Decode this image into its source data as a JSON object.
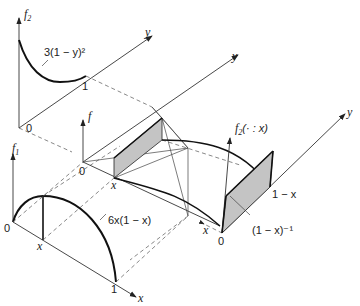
{
  "diagram": {
    "top_panel": {
      "axis_vertical": "f",
      "axis_vertical_sub": "2",
      "axis_depth": "y",
      "origin": "0",
      "tick_one": "1",
      "curve_label": "3(1 − y)²"
    },
    "middle_panel": {
      "axis_vertical": "f",
      "origin": "0",
      "tick_x": "x",
      "axis_depth": "y"
    },
    "bottom_panel": {
      "axis_vertical": "f",
      "axis_vertical_sub": "1",
      "origin": "0",
      "tick_x": "x",
      "tick_one": "1",
      "axis_horizontal": "x",
      "curve_label": "6x(1 − x)"
    },
    "right_panel": {
      "axis_vertical": "f",
      "axis_vertical_sub": "2",
      "axis_vertical_args": "(· : x)",
      "origin": "0",
      "axis_x": "x",
      "axis_depth": "y",
      "tick_one_minus_x": "1 − x",
      "height_label": "(1 − x)⁻¹"
    }
  }
}
